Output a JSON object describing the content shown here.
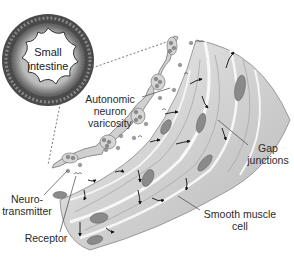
{
  "diagram": {
    "topic": "Smooth muscle innervation by autonomic neuron varicosities",
    "labels": {
      "small_intestine": {
        "line1": "Small",
        "line2": "intestine"
      },
      "autonomic": {
        "line1": "Autonomic",
        "line2": "neuron",
        "line3": "varicosity"
      },
      "gap": {
        "line1": "Gap",
        "line2": "junctions"
      },
      "neuro": {
        "line1": "Neuro-",
        "line2": "transmitter"
      },
      "smooth": {
        "line1": "Smooth muscle",
        "line2": "cell"
      },
      "receptor": {
        "line1": "Receptor"
      }
    },
    "colors": {
      "muscle_fill": "#d4d4d4",
      "muscle_light": "#ececec",
      "muscle_edge": "#9a9a9a",
      "nucleus": "#8a8a8a",
      "neuron_fill": "#cfcfcf",
      "vesicle": "#8c8c8c",
      "intestine_ring": "#3a3a3a",
      "intestine_fill": "#c8c8c8",
      "arrow": "#111111",
      "leader": "#444444"
    }
  }
}
